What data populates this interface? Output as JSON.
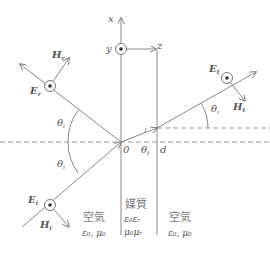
{
  "figure": {
    "axes": {
      "x_label": "x",
      "y_label": "y",
      "z_label": "z",
      "origin_label": "0",
      "thickness_label": "d"
    },
    "waves": {
      "incident": {
        "E_label": "E",
        "E_sub": "i",
        "H_label": "H",
        "H_sub": "i"
      },
      "reflected": {
        "E_label": "E",
        "E_sub": "r",
        "H_label": "H",
        "H_sub": "r"
      },
      "transmitted": {
        "E_label": "E",
        "E_sub": "t",
        "H_label": "H",
        "H_sub": "t"
      }
    },
    "angles": {
      "incident": {
        "symbol": "θ",
        "sub": "i"
      },
      "reflected": {
        "symbol": "θ",
        "sub": "i"
      },
      "refracted": {
        "symbol": "θ",
        "sub": "t"
      },
      "transmitted": {
        "symbol": "θ",
        "sub": "i"
      }
    },
    "regions": {
      "left": {
        "name": "空気",
        "params": "ε₀, μ₀"
      },
      "middle": {
        "name": "媒質",
        "param1": "ε₀εᵣ",
        "param2": "μ₀μᵣ"
      },
      "right": {
        "name": "空気",
        "params": "ε₀, μ₀"
      }
    },
    "colors": {
      "line": "#888888",
      "text": "#555555"
    }
  }
}
